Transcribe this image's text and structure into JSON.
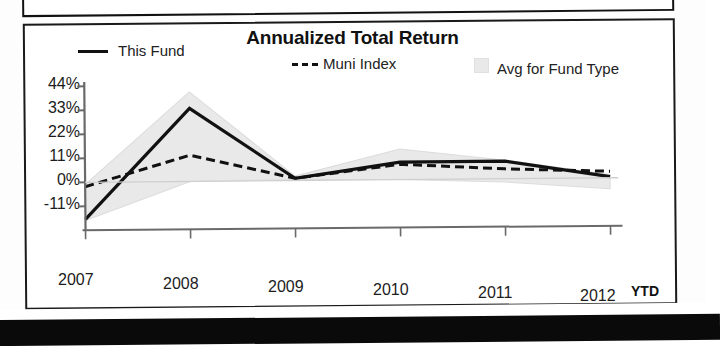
{
  "chart_data": {
    "type": "line",
    "title": "Annualized Total Return",
    "xlabel": "",
    "ylabel": "",
    "x_note": "YTD",
    "categories": [
      "2007",
      "2008",
      "2009",
      "2010",
      "2011",
      "2012"
    ],
    "ytick_labels": [
      "44%",
      "33%",
      "22%",
      "11%",
      "0%",
      "-11%"
    ],
    "ytick_values": [
      44,
      33,
      22,
      11,
      0,
      -11
    ],
    "ylim": [
      -22,
      48
    ],
    "grid": false,
    "legend_position": "top",
    "series": [
      {
        "name": "This Fund",
        "style": "solid",
        "color": "#111111",
        "values": [
          -17.0,
          33.5,
          1.0,
          8.0,
          8.0,
          0.5
        ]
      },
      {
        "name": "Muni Index",
        "style": "dashed",
        "color": "#111111",
        "values": [
          -2.0,
          12.0,
          1.0,
          7.0,
          4.5,
          3.0
        ]
      },
      {
        "name": "Avg for Fund Type",
        "style": "band",
        "color": "#e9e9e9",
        "upper": [
          -1.0,
          41.0,
          2.0,
          14.0,
          8.5,
          1.5
        ],
        "lower": [
          -17.5,
          0.0,
          0.5,
          0.0,
          -1.5,
          -5.0
        ]
      }
    ]
  },
  "legend": {
    "fund_label": "This Fund",
    "muni_label": "Muni Index",
    "muni_prefix": "---",
    "avg_label": "Avg for Fund Type",
    "fund_marker_icon": "solid-line-icon",
    "muni_marker_icon": "dashed-line-icon",
    "avg_marker_icon": "gray-square-swatch-icon"
  },
  "axis": {
    "y_labels": [
      "44%",
      "33%",
      "22%",
      "11%",
      "0%",
      "-11%"
    ],
    "x_labels": [
      "2007",
      "2008",
      "2009",
      "2010",
      "2011",
      "2012"
    ],
    "ytd_label": "YTD"
  },
  "colors": {
    "line": "#111111",
    "band": "#e9e9e9",
    "axis": "#555555",
    "frame": "#1a1a1a"
  }
}
